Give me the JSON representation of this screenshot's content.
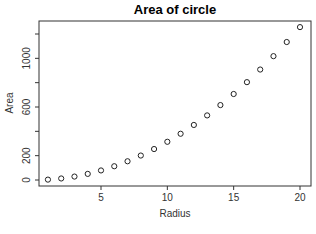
{
  "chart_data": {
    "type": "scatter",
    "title": "Area of circle",
    "xlabel": "Radius",
    "ylabel": "Area",
    "x": [
      1,
      2,
      3,
      4,
      5,
      6,
      7,
      8,
      9,
      10,
      11,
      12,
      13,
      14,
      15,
      16,
      17,
      18,
      19,
      20
    ],
    "y": [
      3.14,
      12.57,
      28.27,
      50.27,
      78.54,
      113.1,
      153.94,
      201.06,
      254.47,
      314.16,
      380.13,
      452.39,
      530.93,
      615.75,
      706.86,
      804.25,
      907.92,
      1017.88,
      1134.11,
      1256.64
    ],
    "xticks": [
      5,
      10,
      15,
      20
    ],
    "yticks": [
      0,
      200,
      400,
      600,
      800,
      1000,
      1200
    ],
    "ytick_labels_shown": [
      "0",
      "200",
      "600",
      "1000"
    ],
    "xlim": [
      0.24,
      20.76
    ],
    "ylim": [
      -47,
      1307
    ],
    "marker": "open-circle",
    "grid": false,
    "legend": null
  }
}
